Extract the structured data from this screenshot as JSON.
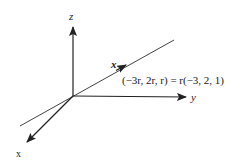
{
  "diagram": {
    "axes": {
      "z_label": "z",
      "y_label": "y",
      "x_label": "x"
    },
    "line": {
      "point_label": "x",
      "equation": "(−3r, 2r, r) = r(−3, 2, 1)"
    },
    "colors": {
      "stroke": "#222222",
      "background": "#ffffff"
    }
  }
}
